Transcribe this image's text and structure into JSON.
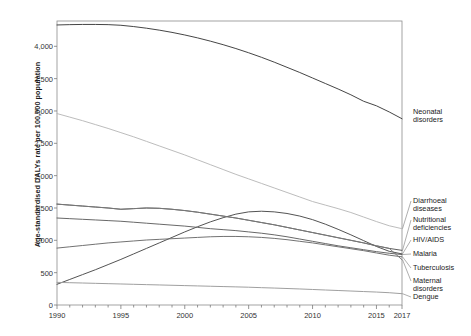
{
  "chart_data": {
    "type": "line",
    "title": "",
    "subtitle": "",
    "xlabel": "",
    "ylabel": "Age-standardised DALYs rate per 100,000 population",
    "xlim": [
      1990,
      2017
    ],
    "ylim": [
      0,
      4500
    ],
    "grid": false,
    "legend_position": "right-of-axes-line-labels",
    "x_ticks": [
      "1990",
      "1995",
      "2000",
      "2005",
      "2010",
      "2015",
      "2017"
    ],
    "x_tick_values": [
      1990,
      1995,
      2000,
      2005,
      2010,
      2015,
      2017
    ],
    "x_minor_ticks": "every year",
    "y_ticks": [
      "0",
      "500",
      "1,000",
      "1,500",
      "2,000",
      "2,500",
      "3,000",
      "3,500",
      "4,000"
    ],
    "y_tick_values": [
      0,
      500,
      1000,
      1500,
      2000,
      2500,
      3000,
      3500,
      4000
    ],
    "x": [
      1990,
      1991,
      1992,
      1993,
      1994,
      1995,
      1996,
      1997,
      1998,
      1999,
      2000,
      2001,
      2002,
      2003,
      2004,
      2005,
      2006,
      2007,
      2008,
      2009,
      2010,
      2011,
      2012,
      2013,
      2014,
      2015,
      2016,
      2017
    ],
    "series": [
      {
        "name": "Neonatal disorders",
        "color": "#3b3b3b",
        "values": [
          4330,
          4335,
          4338,
          4338,
          4335,
          4325,
          4305,
          4280,
          4250,
          4215,
          4175,
          4130,
          4080,
          4025,
          3965,
          3900,
          3830,
          3755,
          3675,
          3595,
          3510,
          3425,
          3340,
          3250,
          3150,
          3080,
          2985,
          2880
        ]
      },
      {
        "name": "Diarrhoeal diseases",
        "color": "#b8b8b8",
        "values": [
          2960,
          2905,
          2850,
          2790,
          2730,
          2665,
          2600,
          2530,
          2460,
          2390,
          2320,
          2245,
          2170,
          2095,
          2020,
          1950,
          1880,
          1810,
          1740,
          1670,
          1600,
          1545,
          1490,
          1430,
          1360,
          1290,
          1225,
          1180
        ]
      },
      {
        "name": "Nutritional deficiencies",
        "color": "#555555",
        "values": [
          1560,
          1545,
          1530,
          1515,
          1500,
          1480,
          1490,
          1500,
          1495,
          1480,
          1460,
          1435,
          1405,
          1375,
          1345,
          1310,
          1275,
          1240,
          1200,
          1160,
          1120,
          1080,
          1040,
          1000,
          960,
          915,
          875,
          845
        ]
      },
      {
        "name": "HIV/AIDS",
        "color": "#4a4a4a",
        "values": [
          320,
          395,
          470,
          545,
          625,
          705,
          790,
          875,
          960,
          1045,
          1130,
          1210,
          1285,
          1350,
          1405,
          1440,
          1450,
          1440,
          1415,
          1375,
          1320,
          1250,
          1170,
          1085,
          995,
          905,
          830,
          790
        ]
      },
      {
        "name": "Malaria",
        "color": "#606060",
        "values": [
          1345,
          1335,
          1325,
          1315,
          1305,
          1295,
          1280,
          1265,
          1250,
          1235,
          1220,
          1200,
          1180,
          1165,
          1150,
          1130,
          1110,
          1085,
          1055,
          1020,
          985,
          950,
          915,
          885,
          855,
          825,
          800,
          780
        ]
      },
      {
        "name": "Tuberculosis",
        "color": "#6a6a6a",
        "values": [
          880,
          900,
          920,
          940,
          960,
          975,
          990,
          1005,
          1015,
          1025,
          1035,
          1045,
          1055,
          1060,
          1060,
          1055,
          1045,
          1030,
          1010,
          985,
          960,
          930,
          900,
          870,
          840,
          805,
          770,
          745
        ]
      },
      {
        "name": "Maternal disorders",
        "color": "#787878",
        "values": [
          1560,
          1545,
          1530,
          1515,
          1500,
          1480,
          1490,
          1500,
          1495,
          1480,
          1460,
          1435,
          1405,
          1375,
          1345,
          1310,
          1275,
          1240,
          1200,
          1160,
          1120,
          1080,
          1040,
          1000,
          960,
          915,
          875,
          700
        ]
      },
      {
        "name": "Dengue",
        "color": "#9a9a9a",
        "values": [
          350,
          345,
          340,
          335,
          330,
          325,
          320,
          315,
          310,
          305,
          300,
          295,
          290,
          285,
          280,
          275,
          268,
          262,
          255,
          248,
          240,
          232,
          224,
          216,
          208,
          200,
          190,
          175
        ]
      }
    ]
  },
  "legend": {
    "items": [
      {
        "label_line1": "Neonatal",
        "label_line2": "disorders"
      },
      {
        "label_line1": "Diarrhoeal",
        "label_line2": "diseases"
      },
      {
        "label_line1": "Nutritional",
        "label_line2": "deficiencies"
      },
      {
        "label_line1": "HIV/AIDS",
        "label_line2": ""
      },
      {
        "label_line1": "Malaria",
        "label_line2": ""
      },
      {
        "label_line1": "Tuberculosis",
        "label_line2": ""
      },
      {
        "label_line1": "Maternal",
        "label_line2": "disorders"
      },
      {
        "label_line1": "Dengue",
        "label_line2": ""
      }
    ]
  }
}
